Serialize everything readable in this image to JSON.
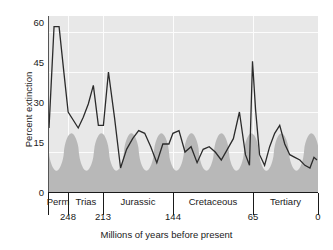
{
  "chart_data": {
    "type": "line",
    "title": "",
    "subtitle": "",
    "xlabel": "Millions of years before present",
    "ylabel": "Percent extinction",
    "xlim": [
      268,
      0
    ],
    "ylim": [
      0,
      66
    ],
    "x_axis_reversed": true,
    "grid": true,
    "grid_color": "#fcfcfc",
    "plot_background": "#e8e8e8",
    "legend": null,
    "legend_position": "none",
    "yticks": [
      0,
      15,
      30,
      45,
      60
    ],
    "xticks": [
      248,
      213,
      144,
      65,
      0
    ],
    "xtick_labels": [
      "248",
      "213",
      "144",
      "65",
      "0"
    ],
    "period_bands": [
      {
        "name": "Perm",
        "start": 268,
        "end": 248
      },
      {
        "name": "Trias",
        "start": 248,
        "end": 213
      },
      {
        "name": "Jurassic",
        "start": 213,
        "end": 144
      },
      {
        "name": "Cretaceous",
        "start": 144,
        "end": 65
      },
      {
        "name": "Tertiary",
        "start": 65,
        "end": 0
      }
    ],
    "series": [
      {
        "name": "Percent extinction",
        "color": "#2b2b2b",
        "type": "line",
        "x": [
          267,
          262,
          257,
          252,
          248,
          243,
          238,
          233,
          228,
          223,
          218,
          213,
          208,
          202,
          196,
          190,
          184,
          178,
          172,
          166,
          160,
          154,
          148,
          144,
          138,
          132,
          126,
          120,
          114,
          108,
          102,
          96,
          90,
          84,
          78,
          72,
          68,
          65,
          62,
          58,
          53,
          48,
          43,
          38,
          33,
          28,
          23,
          18,
          13,
          8,
          4,
          1
        ],
        "values": [
          24,
          62,
          62,
          44,
          30,
          27,
          24,
          28,
          33,
          40,
          25,
          25,
          45,
          28,
          9,
          16,
          20,
          23,
          22,
          17,
          11,
          18,
          18,
          22,
          23,
          15,
          17,
          11,
          16,
          17,
          15,
          12,
          16,
          20,
          30,
          14,
          10,
          49,
          31,
          14,
          10,
          17,
          22,
          25,
          18,
          14,
          13,
          12,
          10,
          9,
          13,
          12
        ]
      },
      {
        "name": "Background extinction band",
        "color": "#b8b8b8",
        "type": "area",
        "note": "smooth oscillating shaded band, peaks near 22 percent and troughs near 8 percent",
        "band_peak": 22,
        "band_trough": 8,
        "lobe_count": 9
      }
    ]
  }
}
